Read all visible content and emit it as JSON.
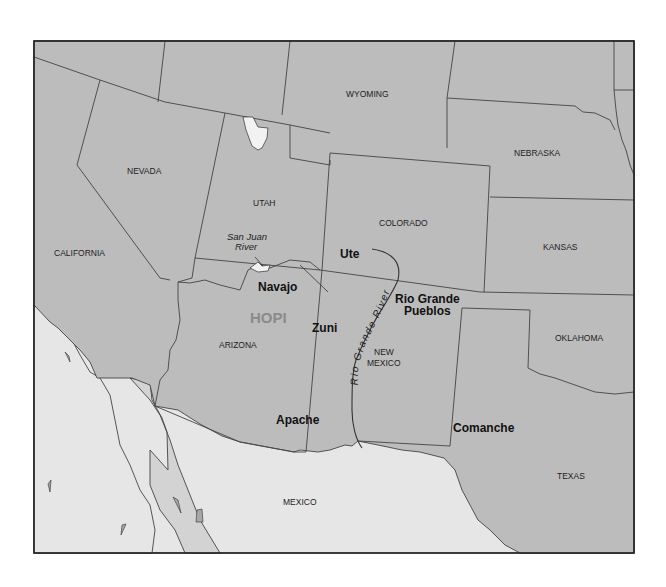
{
  "map": {
    "colors": {
      "us_states": "#bcbcbc",
      "mexico": "#e6e6e6",
      "gulf_of_california": "#d3d3d3",
      "lake": "#f2f2f2",
      "borders": "#444444",
      "hopi_text": "#8a8a8a"
    },
    "states": {
      "wyoming": "WYOMING",
      "nebraska": "NEBRASKA",
      "nevada": "NEVADA",
      "utah": "UTAH",
      "colorado": "COLORADO",
      "kansas": "KANSAS",
      "california": "CALIFORNIA",
      "arizona": "ARIZONA",
      "new_mexico_line1": "NEW",
      "new_mexico_line2": "MEXICO",
      "oklahoma": "OKLAHOMA",
      "texas": "TEXAS",
      "mexico": "MEXICO"
    },
    "tribes": {
      "ute": "Ute",
      "navajo": "Navajo",
      "hopi": "HOPI",
      "zuni": "Zuni",
      "rio_grande_pueblos_line1": "Rio Grande",
      "rio_grande_pueblos_line2": "Pueblos",
      "apache": "Apache",
      "comanche": "Comanche"
    },
    "rivers": {
      "san_juan_line1": "San Juan",
      "san_juan_line2": "River",
      "rio_grande": "Rio Grande River"
    }
  }
}
